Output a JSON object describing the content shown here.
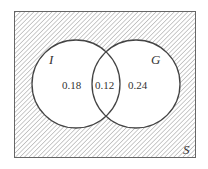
{
  "diagram": {
    "type": "venn",
    "universe_label": "S",
    "sets": [
      {
        "label": "I",
        "only_value": "0.18"
      },
      {
        "label": "G",
        "only_value": "0.24"
      }
    ],
    "intersection_value": "0.12",
    "outside_region": "hatched",
    "colors": {
      "stroke": "#444444",
      "hatch": "#8a8a8a",
      "background": "#ffffff"
    }
  }
}
